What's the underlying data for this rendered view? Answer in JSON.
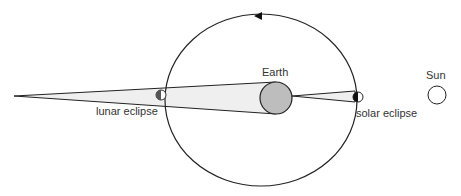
{
  "diagram": {
    "labels": {
      "earth": "Earth",
      "sun": "Sun",
      "lunar_eclipse": "lunar eclipse",
      "solar_eclipse": "solar eclipse"
    },
    "colors": {
      "stroke": "#222222",
      "earth_fill": "#bdbdbd",
      "shadow_fill": "#efefef",
      "moon_dark": "#555555"
    }
  }
}
